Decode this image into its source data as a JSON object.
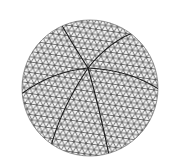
{
  "figure": {
    "caption_fragment": "",
    "sphere": {
      "cx": 90,
      "cy": 88,
      "r": 68
    },
    "hub": {
      "x": 88,
      "y": 68
    },
    "colors": {
      "mesh": "#3a3a3a",
      "major_lines": "#1a1a1a",
      "background": "#ffffff"
    }
  }
}
